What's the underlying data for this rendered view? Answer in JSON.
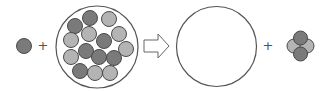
{
  "diagram": {
    "colors": {
      "background": "#ffffff",
      "outline": "#555555",
      "dark_ball": "#7a7a7a",
      "light_ball": "#b4b4b4",
      "ball_stroke": "#4a4a4a"
    },
    "operators": {
      "plus_1": "+",
      "plus_2": "+"
    },
    "lone_ball": {
      "cx": 24,
      "cy": 46,
      "r": 7.5,
      "shade": "dark"
    },
    "full_container": {
      "cx": 97,
      "cy": 47,
      "r": 41,
      "balls": [
        {
          "cx": 90,
          "cy": 18,
          "shade": "dark"
        },
        {
          "cx": 109,
          "cy": 19,
          "shade": "light"
        },
        {
          "cx": 75,
          "cy": 26,
          "shade": "dark"
        },
        {
          "cx": 89,
          "cy": 34,
          "shade": "light"
        },
        {
          "cx": 119,
          "cy": 34,
          "shade": "light"
        },
        {
          "cx": 71,
          "cy": 40,
          "shade": "light"
        },
        {
          "cx": 104,
          "cy": 41,
          "shade": "dark"
        },
        {
          "cx": 126,
          "cy": 49,
          "shade": "light"
        },
        {
          "cx": 86,
          "cy": 51,
          "shade": "dark"
        },
        {
          "cx": 99,
          "cy": 57,
          "shade": "dark"
        },
        {
          "cx": 114,
          "cy": 58,
          "shade": "dark"
        },
        {
          "cx": 71,
          "cy": 57,
          "shade": "light"
        },
        {
          "cx": 80,
          "cy": 71,
          "shade": "dark"
        },
        {
          "cx": 95,
          "cy": 73,
          "shade": "light"
        },
        {
          "cx": 110,
          "cy": 73,
          "shade": "light"
        }
      ],
      "ball_r": 7.5
    },
    "arrow": {
      "direction": "right",
      "x": 144,
      "y": 46
    },
    "empty_container": {
      "cx": 216.5,
      "cy": 46.5,
      "r": 40
    },
    "cluster": {
      "balls": [
        {
          "cx": 294,
          "cy": 46,
          "shade": "light"
        },
        {
          "cx": 307,
          "cy": 46,
          "shade": "light"
        },
        {
          "cx": 300.5,
          "cy": 38,
          "shade": "dark"
        },
        {
          "cx": 300.5,
          "cy": 54,
          "shade": "dark"
        }
      ],
      "ball_r": 7
    }
  }
}
